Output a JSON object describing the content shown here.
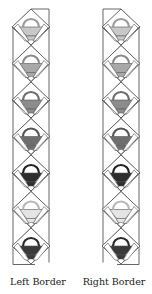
{
  "strips": [
    {
      "id": "left",
      "label": "Left Border",
      "block_count": 7,
      "fills": [
        "#c8c8c8",
        "#a8a8a8",
        "#8c8c8c",
        "#6e6e6e",
        "#2e2e2e",
        "#e4e4e4",
        "#3a3a3a"
      ],
      "handle_colors": [
        "#9a9a9a",
        "#8a8a8a",
        "#6e6e6e",
        "#555555",
        "#222222",
        "#b8b8b8",
        "#2a2a2a"
      ]
    },
    {
      "id": "right",
      "label": "Right Border",
      "block_count": 7,
      "fills": [
        "#c8c8c8",
        "#a8a8a8",
        "#8c8c8c",
        "#6e6e6e",
        "#2e2e2e",
        "#e4e4e4",
        "#3a3a3a"
      ],
      "handle_colors": [
        "#9a9a9a",
        "#8a8a8a",
        "#6e6e6e",
        "#555555",
        "#222222",
        "#b8b8b8",
        "#2a2a2a"
      ]
    }
  ],
  "colors": {
    "line": "#555555",
    "background": "#ffffff"
  }
}
